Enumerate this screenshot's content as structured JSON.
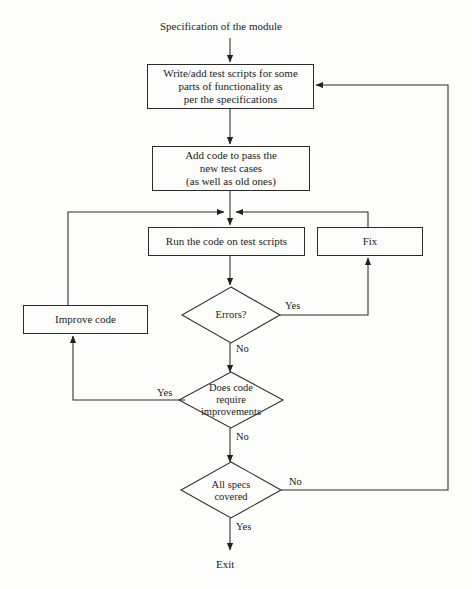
{
  "diagram": {
    "title_text": "Specification of the module",
    "terminal_text": "Exit",
    "stroke_color": "#2a2a2a",
    "background_color": "#fdfdfb",
    "nodes": {
      "write_tests": {
        "shape": "process",
        "line1": "Write/add test scripts for some",
        "line2": "parts of functionality as",
        "line3": "per the specifications"
      },
      "add_code": {
        "shape": "process",
        "line1": "Add code to pass the",
        "line2": "new test cases",
        "line3": "(as well as old ones)"
      },
      "run_code": {
        "shape": "process",
        "line1": "Run the code on test scripts"
      },
      "fix": {
        "shape": "process",
        "line1": "Fix"
      },
      "improve_code": {
        "shape": "process",
        "line1": "Improve code"
      },
      "errors": {
        "shape": "decision",
        "line1": "Errors?"
      },
      "require_improvements": {
        "shape": "decision",
        "line1": "Does code",
        "line2": "require",
        "line3": "improvements"
      },
      "all_specs": {
        "shape": "decision",
        "line1": "All specs",
        "line2": "covered"
      }
    },
    "edge_labels": {
      "errors_yes": "Yes",
      "errors_no": "No",
      "improvements_yes": "Yes",
      "improvements_no": "No",
      "specs_no": "No",
      "specs_yes": "Yes"
    }
  }
}
